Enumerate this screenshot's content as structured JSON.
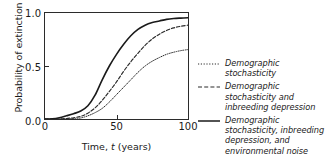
{
  "chart_data": {
    "type": "line",
    "title": "",
    "xlabel": "Time, t (years)",
    "ylabel": "Probability of extinction",
    "xlim": [
      0,
      100
    ],
    "ylim": [
      0.0,
      1.0
    ],
    "xticks": [
      "0",
      "50",
      "100"
    ],
    "xtick_values": [
      0,
      50,
      100
    ],
    "yticks": [
      "0.0",
      "0.5",
      "1.0"
    ],
    "ytick_values": [
      0.0,
      0.5,
      1.0
    ],
    "grid": false,
    "legend_position": "right",
    "x": [
      0,
      5,
      10,
      15,
      20,
      25,
      30,
      35,
      40,
      45,
      50,
      55,
      60,
      65,
      70,
      75,
      80,
      85,
      90,
      95,
      100
    ],
    "series": [
      {
        "name": "Demographic stochasticity",
        "style": "dotted",
        "color": "#2b2b2b",
        "values": [
          0.0,
          0.0,
          0.0,
          0.0,
          0.005,
          0.01,
          0.03,
          0.06,
          0.1,
          0.16,
          0.23,
          0.3,
          0.37,
          0.44,
          0.5,
          0.545,
          0.58,
          0.61,
          0.63,
          0.645,
          0.655
        ]
      },
      {
        "name": "Demographic stochasticity and inbreeding depression",
        "style": "dashed",
        "color": "#2b2b2b",
        "values": [
          0.0,
          0.0,
          0.0,
          0.005,
          0.012,
          0.025,
          0.055,
          0.105,
          0.175,
          0.26,
          0.35,
          0.45,
          0.54,
          0.62,
          0.695,
          0.755,
          0.8,
          0.835,
          0.86,
          0.875,
          0.885
        ]
      },
      {
        "name": "Demographic stochasticity, inbreeding depression, and environmental noise",
        "style": "solid",
        "color": "#1a1a1a",
        "values": [
          0.0,
          0.002,
          0.012,
          0.03,
          0.05,
          0.075,
          0.125,
          0.225,
          0.37,
          0.5,
          0.61,
          0.705,
          0.785,
          0.845,
          0.885,
          0.91,
          0.925,
          0.94,
          0.948,
          0.952,
          0.955
        ]
      }
    ]
  },
  "legend": {
    "items": [
      {
        "label": "Demographic stochasticity"
      },
      {
        "label": "Demographic stochasticity and inbreeding depression"
      },
      {
        "label": "Demographic stochasticity, inbreeding depression, and environmental noise"
      }
    ]
  }
}
